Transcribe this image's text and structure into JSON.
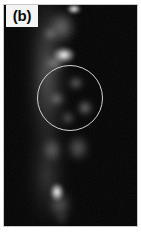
{
  "figure": {
    "domain": "micrograph-panel",
    "panel_label": "(b)",
    "modality": "grayscale fluorescence micrograph",
    "canvas": {
      "width": 141,
      "height": 240
    },
    "plate": {
      "x": 4,
      "y": 5,
      "width": 133,
      "height": 221,
      "background_hex": "#000000"
    },
    "colors": {
      "background_hex": "#FFFFFF",
      "field_hex": "#030303",
      "label_box_hex": "#F4F4F4",
      "label_text_hex": "#0A0A0A",
      "annotation_hex": "#D0D0D0",
      "punctum_hex": "#FFFFFF",
      "haze_hex": "#8C8C8C"
    },
    "label_box": {
      "x": 6,
      "y": 5,
      "width": 32,
      "height": 22
    }
  },
  "annotations": [
    {
      "name": "region-of-interest-circle",
      "shape": "circle",
      "cx": 70,
      "cy": 98,
      "r": 33,
      "stroke_hex": "#D0D0D0",
      "stroke_width": 1.4,
      "fill": "none"
    }
  ],
  "chart_data": {
    "type": "heatmap",
    "title": "(b)",
    "xlabel": "",
    "ylabel": "",
    "colormap": "grayscale",
    "value_range": [
      0,
      255
    ],
    "features": [
      {
        "id": "punctum-top",
        "label": "bright punctum (top)",
        "x": 74,
        "y": 9,
        "rx": 7,
        "ry": 5,
        "intensity": 252
      },
      {
        "id": "haze-upper",
        "label": "diffuse haze (upper)",
        "x": 62,
        "y": 27,
        "rx": 14,
        "ry": 16,
        "intensity": 120
      },
      {
        "id": "punctum-upper-left",
        "label": "small punctum (upper left)",
        "x": 50,
        "y": 34,
        "rx": 6,
        "ry": 6,
        "intensity": 150
      },
      {
        "id": "blob-large-bright",
        "label": "large bright blob",
        "x": 64,
        "y": 55,
        "rx": 11,
        "ry": 8,
        "intensity": 250
      },
      {
        "id": "haze-blob-tail",
        "label": "blob tail haze",
        "x": 55,
        "y": 63,
        "rx": 9,
        "ry": 6,
        "intensity": 170
      },
      {
        "id": "roi-punctum-a",
        "label": "punctum inside ROI (upper)",
        "x": 76,
        "y": 83,
        "rx": 7,
        "ry": 6,
        "intensity": 165
      },
      {
        "id": "roi-punctum-b",
        "label": "punctum inside ROI (left)",
        "x": 57,
        "y": 99,
        "rx": 7,
        "ry": 6,
        "intensity": 160
      },
      {
        "id": "roi-punctum-c",
        "label": "punctum inside ROI (right)",
        "x": 85,
        "y": 108,
        "rx": 7,
        "ry": 7,
        "intensity": 185
      },
      {
        "id": "roi-punctum-d",
        "label": "punctum inside ROI (lower)",
        "x": 68,
        "y": 118,
        "rx": 6,
        "ry": 6,
        "intensity": 145
      },
      {
        "id": "haze-below-roi-left",
        "label": "diffuse lobe below ROI",
        "x": 52,
        "y": 150,
        "rx": 10,
        "ry": 12,
        "intensity": 105
      },
      {
        "id": "haze-below-roi-right",
        "label": "diffuse lobe below ROI (r)",
        "x": 78,
        "y": 148,
        "rx": 11,
        "ry": 13,
        "intensity": 110
      },
      {
        "id": "punctum-lower",
        "label": "bright punctum (lower)",
        "x": 57,
        "y": 192,
        "rx": 7,
        "ry": 9,
        "intensity": 245
      },
      {
        "id": "haze-lower",
        "label": "diffuse haze (lower)",
        "x": 60,
        "y": 205,
        "rx": 12,
        "ry": 14,
        "intensity": 95
      },
      {
        "id": "punctum-bottom",
        "label": "faint punctum (bottom)",
        "x": 62,
        "y": 219,
        "rx": 6,
        "ry": 5,
        "intensity": 70
      }
    ]
  }
}
